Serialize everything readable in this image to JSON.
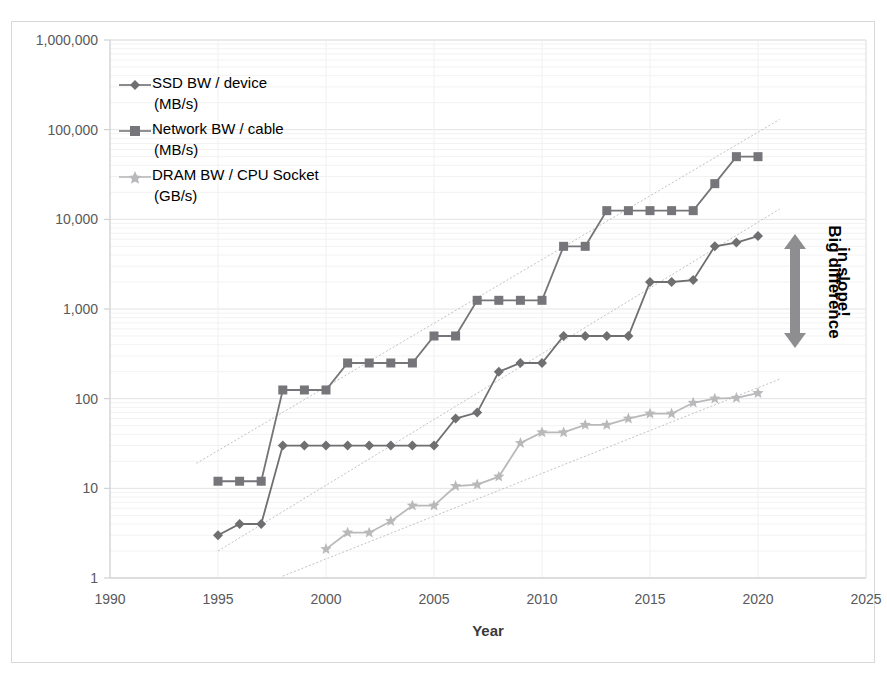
{
  "figure": {
    "background": "#ffffff",
    "border_color": "#d8d8d8"
  },
  "annotation": {
    "label": "Big difference in slope!",
    "line1": "Big difference",
    "line2": "in slope!",
    "arrow_color": "#8e8e90"
  },
  "chart_data": {
    "type": "line",
    "title": "",
    "xlabel": "Year",
    "ylabel": "",
    "yscale": "log",
    "xlim": [
      1990,
      2025
    ],
    "ylim": [
      1,
      1000000
    ],
    "grid": true,
    "legend_position": "inside-top-left",
    "xticks": [
      1990,
      1995,
      2000,
      2005,
      2010,
      2015,
      2020,
      2025
    ],
    "xtick_labels": [
      "1990",
      "1995",
      "2000",
      "2005",
      "2010",
      "2015",
      "2020",
      "2025"
    ],
    "yticks": [
      1,
      10,
      100,
      1000,
      10000,
      100000,
      1000000
    ],
    "ytick_labels": [
      "1",
      "10",
      "100",
      "1,000",
      "10,000",
      "100,000",
      "1,000,000"
    ],
    "series": [
      {
        "name": "SSD BW / device (MB/s)",
        "legend_line1": "SSD BW / device",
        "legend_line2": "(MB/s)",
        "marker": "diamond",
        "color": "#6f6f71",
        "x": [
          1995,
          1996,
          1997,
          1998,
          1999,
          2000,
          2001,
          2002,
          2003,
          2004,
          2005,
          2006,
          2007,
          2008,
          2009,
          2010,
          2011,
          2012,
          2013,
          2014,
          2015,
          2016,
          2017,
          2018,
          2019,
          2020
        ],
        "y": [
          3,
          4,
          4,
          30,
          30,
          30,
          30,
          30,
          30,
          30,
          30,
          60,
          70,
          200,
          250,
          250,
          500,
          500,
          500,
          500,
          2000,
          2000,
          2100,
          5000,
          5500,
          6500
        ],
        "trend": {
          "x": [
            1995,
            2021
          ],
          "y": [
            2.0,
            13000
          ]
        }
      },
      {
        "name": "Network BW / cable (MB/s)",
        "legend_line1": "Network BW / cable",
        "legend_line2": "(MB/s)",
        "marker": "square",
        "color": "#76767a",
        "x": [
          1995,
          1996,
          1997,
          1998,
          1999,
          2000,
          2001,
          2002,
          2003,
          2004,
          2005,
          2006,
          2007,
          2008,
          2009,
          2010,
          2011,
          2012,
          2013,
          2014,
          2015,
          2016,
          2017,
          2018,
          2019,
          2020
        ],
        "y": [
          12,
          12,
          12,
          125,
          125,
          125,
          250,
          250,
          250,
          250,
          500,
          500,
          1250,
          1250,
          1250,
          1250,
          5000,
          5000,
          12500,
          12500,
          12500,
          12500,
          12500,
          25000,
          50000,
          50000
        ],
        "trend": {
          "x": [
            1994,
            2021
          ],
          "y": [
            19,
            130000
          ]
        }
      },
      {
        "name": "DRAM BW / CPU Socket (GB/s)",
        "legend_line1": "DRAM BW / CPU Socket",
        "legend_line2": "(GB/s)",
        "marker": "star",
        "color": "#b9b9bb",
        "x": [
          2000,
          2001,
          2002,
          2003,
          2004,
          2005,
          2006,
          2007,
          2008,
          2009,
          2010,
          2011,
          2012,
          2013,
          2014,
          2015,
          2016,
          2017,
          2018,
          2019,
          2020
        ],
        "y": [
          2.1,
          3.2,
          3.2,
          4.3,
          6.4,
          6.4,
          10.6,
          11,
          13.5,
          32,
          42,
          42,
          51,
          51,
          60,
          68,
          68,
          90,
          100,
          102,
          115
        ],
        "trend": {
          "x": [
            1998,
            2021
          ],
          "y": [
            1.05,
            165
          ]
        }
      }
    ]
  }
}
